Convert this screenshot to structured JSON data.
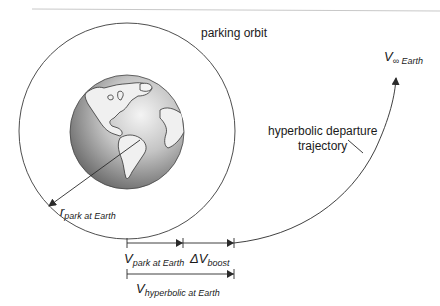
{
  "labels": {
    "parking_orbit": "parking orbit",
    "hyperbolic_trajectory_line1": "hyperbolic departure",
    "hyperbolic_trajectory_line2": "trajectory",
    "v_inf_main": "V",
    "v_inf_sub": "∞ Earth",
    "r_park_main": "r",
    "r_park_sub": "park at Earth",
    "v_park_main": "V",
    "v_park_sub": "park at Earth",
    "dv_boost_main": "ΔV",
    "dv_boost_sub": "boost",
    "v_hyp_main": "V",
    "v_hyp_sub": "hyperbolic at Earth"
  },
  "colors": {
    "line": "#2a2a2a",
    "earth_dark": "#6e6e6e",
    "earth_light": "#e8e8e8",
    "land": "#f2f2f2",
    "rule": "#c8c8c8"
  },
  "geometry": {
    "orbit": {
      "cx": 127,
      "cy": 131,
      "r": 108
    },
    "earth": {
      "cx": 127,
      "cy": 132,
      "r": 57
    },
    "velocity_line_y": 243,
    "hyperbolic_line_y": 274,
    "tick_x": 127,
    "park_arrow_end_x": 183,
    "boost_arrow_end_x": 234
  }
}
